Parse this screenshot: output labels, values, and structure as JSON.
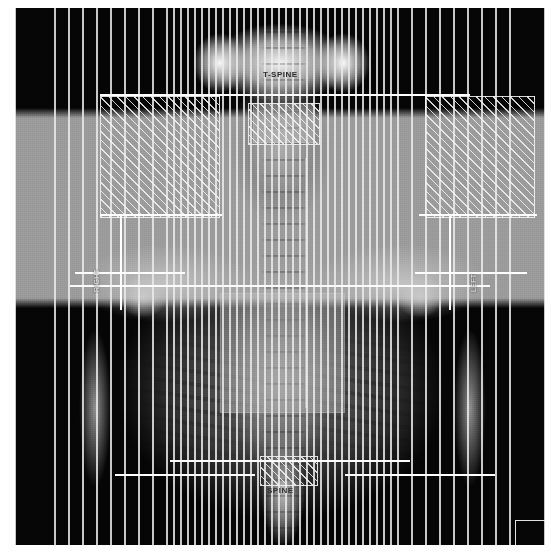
{
  "view": {
    "title": "Beam's Eye View - DRR",
    "modality": "CT / DRR",
    "orientation": "Coronal",
    "background_color": "#050505",
    "outline_color": "#ffffff",
    "overlay_color": "#bebebe"
  },
  "annotations": {
    "top_label": "T-SPINE",
    "bottom_label": "SPINE",
    "left_label": "RIGHT",
    "right_label": "LEFT"
  },
  "mlc": {
    "leaf_count_total": 60,
    "narrow_leaf_width_px": 7,
    "wide_leaf_width_px": 14,
    "leaf_border_color": "#ebebeb",
    "hatch_color": "#f5f5f5",
    "leaves": [
      {
        "x": 0,
        "w": 40,
        "wide": true
      },
      {
        "x": 40,
        "w": 14,
        "wide": true
      },
      {
        "x": 54,
        "w": 14,
        "wide": true
      },
      {
        "x": 68,
        "w": 14,
        "wide": true
      },
      {
        "x": 82,
        "w": 14,
        "wide": true
      },
      {
        "x": 96,
        "w": 14,
        "wide": true
      },
      {
        "x": 110,
        "w": 14,
        "wide": true
      },
      {
        "x": 124,
        "w": 14,
        "wide": true
      },
      {
        "x": 138,
        "w": 14,
        "wide": true
      },
      {
        "x": 152,
        "w": 7,
        "wide": false
      },
      {
        "x": 159,
        "w": 7,
        "wide": false
      },
      {
        "x": 166,
        "w": 7,
        "wide": false
      },
      {
        "x": 173,
        "w": 7,
        "wide": false
      },
      {
        "x": 180,
        "w": 7,
        "wide": false
      },
      {
        "x": 187,
        "w": 7,
        "wide": false
      },
      {
        "x": 194,
        "w": 7,
        "wide": false
      },
      {
        "x": 201,
        "w": 7,
        "wide": false
      },
      {
        "x": 208,
        "w": 7,
        "wide": false
      },
      {
        "x": 215,
        "w": 7,
        "wide": false
      },
      {
        "x": 222,
        "w": 7,
        "wide": false
      },
      {
        "x": 229,
        "w": 7,
        "wide": false
      },
      {
        "x": 236,
        "w": 7,
        "wide": false
      },
      {
        "x": 243,
        "w": 7,
        "wide": false
      },
      {
        "x": 250,
        "w": 7,
        "wide": false
      },
      {
        "x": 257,
        "w": 7,
        "wide": false
      },
      {
        "x": 264,
        "w": 7,
        "wide": false
      },
      {
        "x": 271,
        "w": 7,
        "wide": false
      },
      {
        "x": 278,
        "w": 7,
        "wide": false
      },
      {
        "x": 285,
        "w": 7,
        "wide": false
      },
      {
        "x": 292,
        "w": 7,
        "wide": false
      },
      {
        "x": 299,
        "w": 7,
        "wide": false
      },
      {
        "x": 306,
        "w": 7,
        "wide": false
      },
      {
        "x": 313,
        "w": 7,
        "wide": false
      },
      {
        "x": 320,
        "w": 7,
        "wide": false
      },
      {
        "x": 327,
        "w": 7,
        "wide": false
      },
      {
        "x": 334,
        "w": 7,
        "wide": false
      },
      {
        "x": 341,
        "w": 7,
        "wide": false
      },
      {
        "x": 348,
        "w": 7,
        "wide": false
      },
      {
        "x": 355,
        "w": 7,
        "wide": false
      },
      {
        "x": 362,
        "w": 7,
        "wide": false
      },
      {
        "x": 369,
        "w": 7,
        "wide": false
      },
      {
        "x": 376,
        "w": 7,
        "wide": false
      },
      {
        "x": 383,
        "w": 14,
        "wide": true
      },
      {
        "x": 397,
        "w": 14,
        "wide": true
      },
      {
        "x": 411,
        "w": 14,
        "wide": true
      },
      {
        "x": 425,
        "w": 14,
        "wide": true
      },
      {
        "x": 439,
        "w": 14,
        "wide": true
      },
      {
        "x": 453,
        "w": 14,
        "wide": true
      },
      {
        "x": 467,
        "w": 14,
        "wide": true
      },
      {
        "x": 481,
        "w": 14,
        "wide": true
      },
      {
        "x": 495,
        "w": 35,
        "wide": true
      }
    ],
    "hatched_blocks": [
      {
        "x": 85,
        "y": 88,
        "w": 120,
        "h": 122
      },
      {
        "x": 410,
        "y": 88,
        "w": 110,
        "h": 122
      },
      {
        "x": 233,
        "y": 95,
        "w": 72,
        "h": 42
      },
      {
        "x": 245,
        "y": 448,
        "w": 58,
        "h": 30
      }
    ]
  },
  "aperture": {
    "segments": [
      {
        "x": 85,
        "y": 86,
        "w": 370,
        "h": 2
      },
      {
        "x": 85,
        "y": 206,
        "w": 122,
        "h": 2
      },
      {
        "x": 404,
        "y": 206,
        "w": 118,
        "h": 2
      },
      {
        "x": 105,
        "y": 206,
        "w": 2,
        "h": 96
      },
      {
        "x": 434,
        "y": 206,
        "w": 2,
        "h": 96
      },
      {
        "x": 60,
        "y": 264,
        "w": 110,
        "h": 2
      },
      {
        "x": 400,
        "y": 264,
        "w": 112,
        "h": 2
      },
      {
        "x": 155,
        "y": 452,
        "w": 240,
        "h": 2
      },
      {
        "x": 100,
        "y": 466,
        "w": 140,
        "h": 2
      },
      {
        "x": 330,
        "y": 466,
        "w": 150,
        "h": 2
      }
    ],
    "crosshair": {
      "h_y": 277,
      "v_x": 290,
      "color": "#ffffff"
    }
  },
  "structures": [
    {
      "name": "mediastinum-target",
      "x": 205,
      "y": 285,
      "w": 125,
      "h": 120
    },
    {
      "name": "neck-target",
      "x": 238,
      "y": 95,
      "w": 62,
      "h": 40
    }
  ],
  "corner_marker": {
    "x": 500,
    "y": 512,
    "w": 34,
    "h": 30
  }
}
